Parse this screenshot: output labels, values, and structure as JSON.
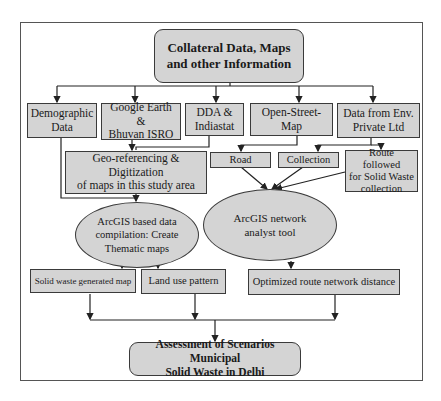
{
  "diagram": {
    "top": {
      "label": "Collateral Data, Maps\nand other Information"
    },
    "sources": [
      {
        "label": "Demographic\nData"
      },
      {
        "label": "Google Earth &\nBhuvan ISRO"
      },
      {
        "label": "DDA &\nIndiastat"
      },
      {
        "label": "Open-Street-\nMap"
      },
      {
        "label": "Data from Env.\nPrivate Ltd"
      }
    ],
    "georef": {
      "label": "Geo-referencing & Digitization\nof maps in this study area"
    },
    "network_inputs": [
      {
        "label": "Road"
      },
      {
        "label": "Collection"
      },
      {
        "label": "Route followed\nfor Solid Waste\ncollection"
      }
    ],
    "process_left": {
      "label": "ArcGIS based data\ncompilation: Create\nThematic maps"
    },
    "process_right": {
      "label": "ArcGIS network\nanalyst tool"
    },
    "outputs": [
      {
        "label": "Solid waste generated map"
      },
      {
        "label": "Land use pattern"
      },
      {
        "label": "Optimized route network distance"
      }
    ],
    "final": {
      "label": "Assessment of Scenarios Municipal\nSolid Waste in Delhi"
    },
    "colors": {
      "fill": "#d4d4d4",
      "stroke": "#3a3a3a",
      "frame": "#555555"
    }
  }
}
